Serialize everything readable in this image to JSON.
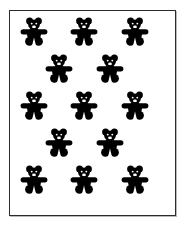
{
  "card": {
    "title": "Teddy bear pattern card",
    "border_color": "#2b2b2b",
    "background_color": "#ffffff",
    "shadow_color": "#b9b9b9",
    "frame": {
      "x": 9,
      "y": 10,
      "width": 167,
      "height": 206
    }
  },
  "motif": {
    "name": "teddy-bear-silhouette",
    "fill_color": "#000000",
    "eye_color": "#ffffff",
    "muzzle_color": "#ffffff",
    "count_total": 13,
    "width": 28,
    "height": 29
  },
  "layout": {
    "arrangement": "quincunx",
    "rows_pattern": [
      3,
      2,
      3,
      2,
      3
    ],
    "row_count": 5
  },
  "bears": [
    {
      "id": "bear-r1-c1",
      "row": 1,
      "col": 1,
      "x": 19,
      "y": 16
    },
    {
      "id": "bear-r1-c2",
      "row": 1,
      "col": 2,
      "x": 69,
      "y": 16
    },
    {
      "id": "bear-r1-c3",
      "row": 1,
      "col": 3,
      "x": 120,
      "y": 16
    },
    {
      "id": "bear-r2-c1",
      "row": 2,
      "col": 1,
      "x": 44,
      "y": 53
    },
    {
      "id": "bear-r2-c2",
      "row": 2,
      "col": 2,
      "x": 95,
      "y": 53
    },
    {
      "id": "bear-r3-c1",
      "row": 3,
      "col": 1,
      "x": 19,
      "y": 90
    },
    {
      "id": "bear-r3-c2",
      "row": 3,
      "col": 2,
      "x": 69,
      "y": 90
    },
    {
      "id": "bear-r3-c3",
      "row": 3,
      "col": 3,
      "x": 120,
      "y": 90
    },
    {
      "id": "bear-r4-c1",
      "row": 4,
      "col": 1,
      "x": 44,
      "y": 127
    },
    {
      "id": "bear-r4-c2",
      "row": 4,
      "col": 2,
      "x": 95,
      "y": 127
    },
    {
      "id": "bear-r5-c1",
      "row": 5,
      "col": 1,
      "x": 19,
      "y": 164
    },
    {
      "id": "bear-r5-c2",
      "row": 5,
      "col": 2,
      "x": 69,
      "y": 164
    },
    {
      "id": "bear-r5-c3",
      "row": 5,
      "col": 3,
      "x": 120,
      "y": 164
    }
  ]
}
